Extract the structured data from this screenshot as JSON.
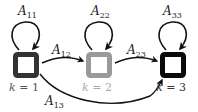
{
  "diagram": {
    "type": "markov-chain-state-diagram",
    "states": [
      {
        "id": "1",
        "label_var": "k",
        "label_eq": " = ",
        "label_val": "1",
        "color": "#333333",
        "label_color": "#555555"
      },
      {
        "id": "2",
        "label_var": "k",
        "label_eq": " = ",
        "label_val": "2",
        "color": "#9a9a9a",
        "label_color": "#aaaaaa"
      },
      {
        "id": "3",
        "label_var": "k",
        "label_eq": " = ",
        "label_val": "3",
        "color": "#0a0a0a",
        "label_color": "#333333"
      }
    ],
    "self_loops": [
      {
        "base": "A",
        "sub": "11"
      },
      {
        "base": "A",
        "sub": "22"
      },
      {
        "base": "A",
        "sub": "33"
      }
    ],
    "transitions": [
      {
        "from": "1",
        "to": "2",
        "base": "A",
        "sub": "12"
      },
      {
        "from": "2",
        "to": "3",
        "base": "A",
        "sub": "23"
      },
      {
        "from": "1",
        "to": "3",
        "base": "A",
        "sub": "13"
      }
    ],
    "edge_color": "#111111"
  }
}
